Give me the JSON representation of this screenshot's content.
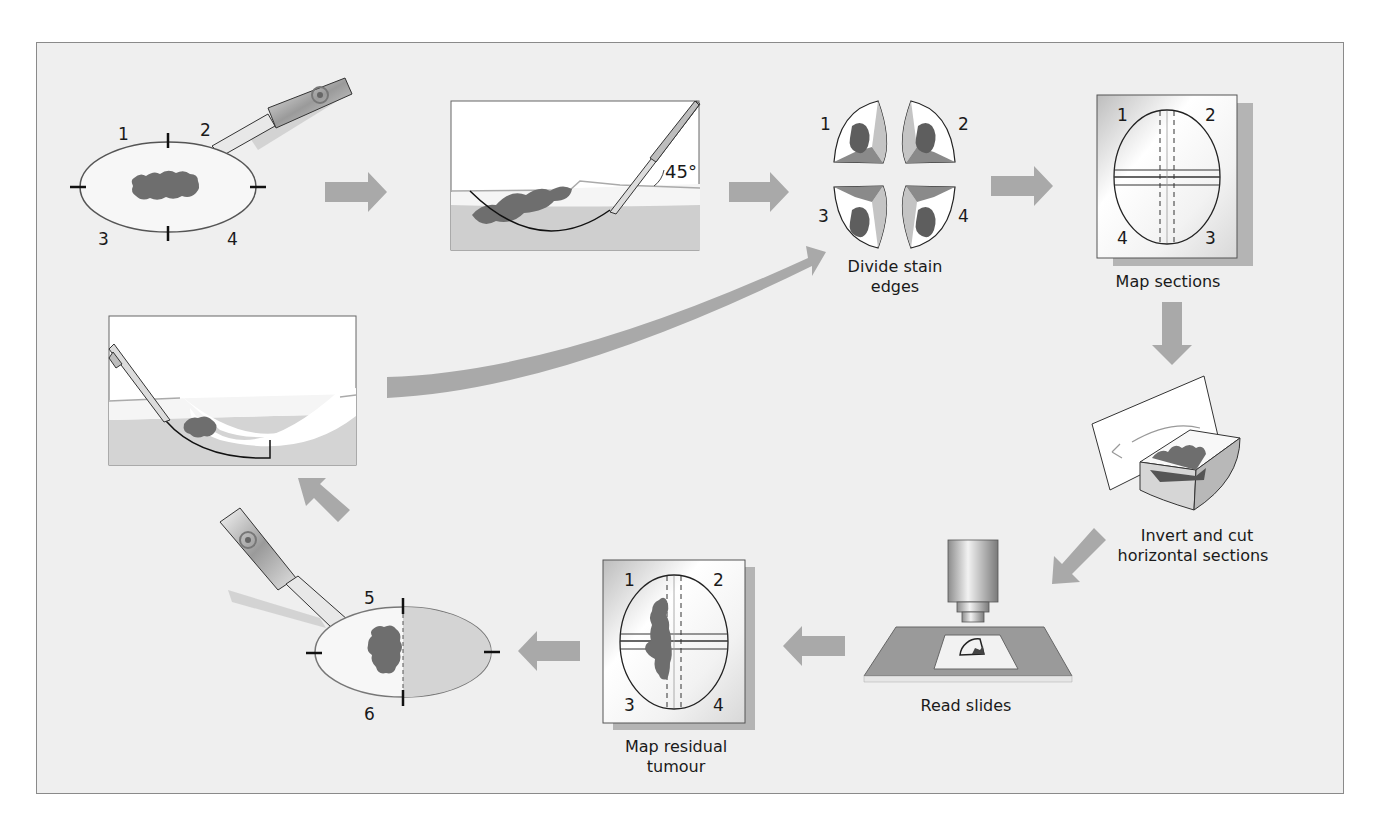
{
  "diagram": {
    "colors": {
      "background": "#efefef",
      "frame_border": "#8a8a8a",
      "arrow": "#a9a9a9",
      "tumour": "#6e6e6e",
      "tissue": "#d4d4d4",
      "outline": "#1a1a1a"
    },
    "steps": [
      {
        "id": "mark-specimen",
        "labels": [
          "1",
          "2",
          "3",
          "4"
        ],
        "caption": ""
      },
      {
        "id": "excise-45",
        "angle_label": "45°",
        "caption": ""
      },
      {
        "id": "divide-stain",
        "labels": [
          "1",
          "2",
          "3",
          "4"
        ],
        "caption_line1": "Divide stain",
        "caption_line2": "edges"
      },
      {
        "id": "map-sections",
        "labels": [
          "1",
          "2",
          "4",
          "3"
        ],
        "caption": "Map sections"
      },
      {
        "id": "invert-cut",
        "caption_line1": "Invert and cut",
        "caption_line2": "horizontal sections"
      },
      {
        "id": "read-slides",
        "caption": "Read slides"
      },
      {
        "id": "map-residual",
        "labels": [
          "1",
          "2",
          "3",
          "4"
        ],
        "caption_line1": "Map residual",
        "caption_line2": "tumour"
      },
      {
        "id": "re-excise",
        "labels": [
          "5",
          "6"
        ],
        "caption": ""
      },
      {
        "id": "re-excision-profile",
        "caption": ""
      }
    ]
  }
}
